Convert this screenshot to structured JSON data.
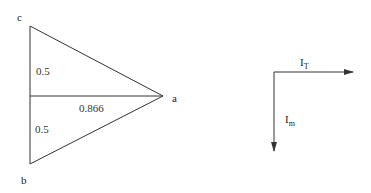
{
  "triangle": {
    "vertices": {
      "c": {
        "label": "c"
      },
      "b": {
        "label": "b"
      },
      "a": {
        "label": "a"
      }
    },
    "segments": {
      "upper_half": "0.5",
      "lower_half": "0.5",
      "median": "0.866"
    }
  },
  "vectors": {
    "horizontal": {
      "label_main": "I",
      "label_sub": "T"
    },
    "vertical": {
      "label_main": "I",
      "label_sub": "m"
    }
  },
  "colors": {
    "stroke": "#333333",
    "text": "#222222"
  }
}
